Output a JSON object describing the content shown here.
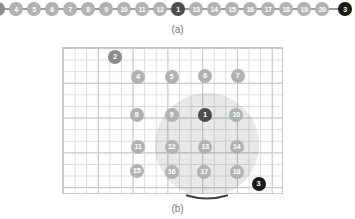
{
  "figure": {
    "panel_a": {
      "caption": "(a)",
      "node_y": 9,
      "node_size": 13.5,
      "nodes": [
        {
          "label": "2",
          "variant": "medium",
          "x": -2
        },
        {
          "label": "4",
          "variant": "light",
          "x": 16
        },
        {
          "label": "5",
          "variant": "light",
          "x": 34
        },
        {
          "label": "6",
          "variant": "light",
          "x": 52
        },
        {
          "label": "7",
          "variant": "light",
          "x": 70
        },
        {
          "label": "8",
          "variant": "light",
          "x": 88
        },
        {
          "label": "9",
          "variant": "light",
          "x": 106
        },
        {
          "label": "10",
          "variant": "light",
          "x": 124
        },
        {
          "label": "11",
          "variant": "light",
          "x": 142
        },
        {
          "label": "12",
          "variant": "light",
          "x": 160
        },
        {
          "label": "1",
          "variant": "dark",
          "x": 178
        },
        {
          "label": "13",
          "variant": "light",
          "x": 196
        },
        {
          "label": "14",
          "variant": "light",
          "x": 214
        },
        {
          "label": "15",
          "variant": "light",
          "x": 232
        },
        {
          "label": "16",
          "variant": "light",
          "x": 250
        },
        {
          "label": "17",
          "variant": "light",
          "x": 268
        },
        {
          "label": "18",
          "variant": "light",
          "x": 286
        },
        {
          "label": "19",
          "variant": "light",
          "x": 304
        },
        {
          "label": "20",
          "variant": "light",
          "x": 322
        },
        {
          "label": "3",
          "variant": "black",
          "x": 345
        }
      ]
    },
    "panel_b": {
      "caption": "(b)",
      "node_size": 14,
      "grid": {
        "left": 62,
        "top": 47,
        "width": 221,
        "height": 147
      },
      "range_circle": {
        "cx": 206.5,
        "cy": 145,
        "r": 52
      },
      "nodes": [
        {
          "label": "2",
          "variant": "medium",
          "x": 115,
          "y": 56.5
        },
        {
          "label": "4",
          "variant": "light",
          "x": 138,
          "y": 77
        },
        {
          "label": "5",
          "variant": "light",
          "x": 171.5,
          "y": 77
        },
        {
          "label": "6",
          "variant": "light",
          "x": 205,
          "y": 75.5
        },
        {
          "label": "7",
          "variant": "light",
          "x": 237.5,
          "y": 75.5
        },
        {
          "label": "8",
          "variant": "light",
          "x": 136.5,
          "y": 115
        },
        {
          "label": "9",
          "variant": "light",
          "x": 171.5,
          "y": 115
        },
        {
          "label": "1",
          "variant": "dark",
          "x": 205,
          "y": 115
        },
        {
          "label": "10",
          "variant": "light",
          "x": 236,
          "y": 115
        },
        {
          "label": "11",
          "variant": "light",
          "x": 138,
          "y": 146.5
        },
        {
          "label": "12",
          "variant": "light",
          "x": 171.5,
          "y": 146.5
        },
        {
          "label": "13",
          "variant": "light",
          "x": 205,
          "y": 146.5
        },
        {
          "label": "14",
          "variant": "light",
          "x": 236.5,
          "y": 146.5
        },
        {
          "label": "15",
          "variant": "light",
          "x": 136.5,
          "y": 171
        },
        {
          "label": "16",
          "variant": "light",
          "x": 171.5,
          "y": 171.5
        },
        {
          "label": "17",
          "variant": "light",
          "x": 204,
          "y": 172
        },
        {
          "label": "18",
          "variant": "light",
          "x": 236.5,
          "y": 171.5
        },
        {
          "label": "3",
          "variant": "black",
          "x": 258.5,
          "y": 183.5
        }
      ]
    },
    "colors": {
      "node-light": "#b2b2b2",
      "node-medium": "#8c8c8c",
      "node-dark": "#4d4d4d",
      "node-black": "#1a1a1a",
      "node-text": "#ffffff",
      "chain-line": "#9e9e9e",
      "grid-minor": "#dddddd",
      "grid-major": "#c9c9c9",
      "range-fill": "rgba(0,0,0,0.09)",
      "range-arc": "#3f3f3f",
      "caption": "#777777"
    }
  }
}
